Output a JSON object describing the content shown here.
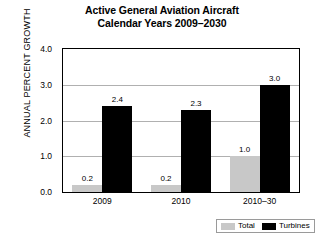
{
  "chart_data": {
    "type": "bar",
    "title": "Active General Aviation Aircraft Calendar Years 2009–2030",
    "title_lines": [
      "Active General Aviation Aircraft",
      "Calendar Years 2009–2030"
    ],
    "xlabel": "",
    "ylabel": "ANNUAL PERCENT GROWTH",
    "categories": [
      "2009",
      "2010",
      "2010–30"
    ],
    "series": [
      {
        "name": "Total",
        "values": [
          0.2,
          0.2,
          1.0
        ],
        "color": "#c8c8c8"
      },
      {
        "name": "Turbines",
        "values": [
          2.4,
          2.3,
          3.0
        ],
        "color": "#000000"
      }
    ],
    "ylim": [
      0.0,
      4.0
    ],
    "ytick_labels": [
      "0.0",
      "1.0",
      "2.0",
      "3.0",
      "4.0"
    ],
    "ytick_values": [
      0.0,
      1.0,
      2.0,
      3.0,
      4.0
    ],
    "yminor_values": [
      0.5,
      1.5,
      2.5,
      3.5
    ],
    "gridlines": [
      1.0,
      2.0,
      3.0
    ],
    "grid": true,
    "legend_position": "bottom-right",
    "data_labels": [
      {
        "group": "2009",
        "series": "Total",
        "text": "0.2"
      },
      {
        "group": "2009",
        "series": "Turbines",
        "text": "2.4"
      },
      {
        "group": "2010",
        "series": "Total",
        "text": "0.2"
      },
      {
        "group": "2010",
        "series": "Turbines",
        "text": "2.3"
      },
      {
        "group": "2010–30",
        "series": "Total",
        "text": "1.0"
      },
      {
        "group": "2010–30",
        "series": "Turbines",
        "text": "3.0"
      }
    ]
  },
  "legend": {
    "entries": [
      {
        "label": "Total",
        "color": "#c8c8c8"
      },
      {
        "label": "Turbines",
        "color": "#000000"
      }
    ]
  }
}
